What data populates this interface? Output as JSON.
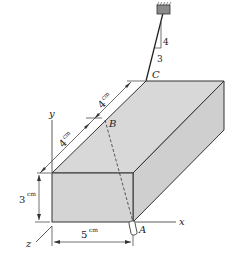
{
  "figure": {
    "points": {
      "A": "A",
      "B": "B",
      "C": "C"
    },
    "axes": {
      "x": "x",
      "y": "y",
      "z": "z"
    },
    "dimensions": {
      "height": "3",
      "height_unit": "cm",
      "width": "5",
      "width_unit": "cm",
      "length_1": "4",
      "length_1_unit": "cm",
      "length_2": "4",
      "length_2_unit": "cm"
    },
    "slope": {
      "rise": "4",
      "run": "3"
    },
    "colors": {
      "box_fill": "#d4d4d4",
      "edge": "#333333",
      "background": "#ffffff"
    }
  }
}
